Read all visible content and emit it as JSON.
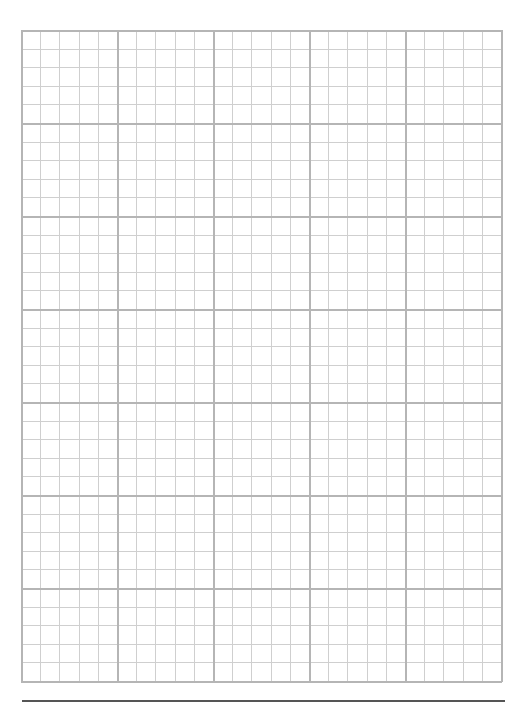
{
  "page": {
    "type": "graph-paper",
    "background_color": "#ffffff"
  },
  "grid": {
    "left": 21,
    "top": 30,
    "width": 480,
    "height": 651,
    "columns": 25,
    "rows": 35,
    "major_every": 5,
    "minor_color": "#cfcfcf",
    "major_color": "#b5b5b5",
    "border_color": "#b5b5b5"
  },
  "bottom_rule": {
    "color": "#555555"
  }
}
